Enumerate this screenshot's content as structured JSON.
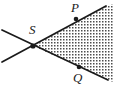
{
  "figure": {
    "type": "geometry-diagram",
    "width": 113,
    "height": 91,
    "background_color": "#ffffff",
    "line_color": "#1a1a1a",
    "fill_pattern": "dotted-stipple",
    "fill_color": "#4d4d4d",
    "labels": {
      "vertex": "S",
      "upper_point": "P",
      "lower_point": "Q"
    },
    "points": [
      {
        "name": "S",
        "label": "S",
        "x": 33,
        "y": 46,
        "marked": true,
        "label_x": 29,
        "label_y": 23
      },
      {
        "name": "P",
        "label": "P",
        "x": 76,
        "y": 19,
        "marked": true,
        "label_x": 71,
        "label_y": 1
      },
      {
        "name": "Q",
        "label": "Q",
        "x": 79,
        "y": 67,
        "marked": true,
        "label_x": 73,
        "label_y": 71
      }
    ],
    "lines": [
      {
        "name": "line-through-S-and-P",
        "x1": 2,
        "y1": 62,
        "x2": 106,
        "y2": 6
      },
      {
        "name": "line-through-S-and-Q",
        "x1": 2,
        "y1": 30,
        "x2": 108,
        "y2": 80
      }
    ],
    "shaded_region": {
      "name": "angle-wedge-PSQ",
      "vertices": [
        [
          33,
          46
        ],
        [
          106,
          6
        ],
        [
          113,
          6
        ],
        [
          113,
          77
        ],
        [
          108,
          80
        ]
      ]
    }
  }
}
